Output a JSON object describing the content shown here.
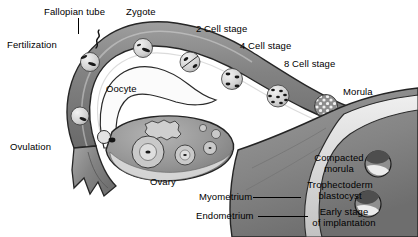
{
  "diagram": {
    "type": "anatomical-illustration",
    "style": "grayscale halftone medical illustration",
    "background_color": "#ffffff",
    "text_color": "#000000"
  },
  "labels": {
    "fallopian_tube": "Fallopian tube",
    "zygote": "Zygote",
    "fertilization": "Fertilization",
    "two_cell": "2 Cell stage",
    "four_cell": "4 Cell stage",
    "eight_cell": "8 Cell stage",
    "oocyte": "Oocyte",
    "morula": "Morula",
    "ovulation": "Ovulation",
    "ovary": "Ovary",
    "myometrium": "Myometrium",
    "endometrium": "Endometrium",
    "compacted_morula_l1": "Compacted",
    "compacted_morula_l2": "morula",
    "trophectoderm_l1": "Trophectoderm",
    "trophectoderm_l2": "blastocyst",
    "early_stage_l1": "Early stage",
    "early_stage_l2": "of implantation"
  },
  "structures": {
    "tube_wall_color": "#8a8a8a",
    "tube_wall_dark": "#6d6d6d",
    "lumen_color": "#d8d8d8",
    "ovary_color": "#9a9a9a",
    "uterus_color": "#8f8f8f",
    "highlight_color": "#e8e8e8",
    "outline_color": "#1a1a1a"
  },
  "stages": [
    {
      "name": "fertilization",
      "cells": 1,
      "note": "oocyte with sperm"
    },
    {
      "name": "zygote",
      "cells": 1
    },
    {
      "name": "2 cell stage",
      "cells": 2
    },
    {
      "name": "4 cell stage",
      "cells": 4
    },
    {
      "name": "8 cell stage",
      "cells": 8
    },
    {
      "name": "morula",
      "cells": 16
    },
    {
      "name": "compacted morula",
      "cells": 32
    },
    {
      "name": "trophectoderm blastocyst",
      "cells": 64
    },
    {
      "name": "early stage of implantation",
      "cells": 100
    }
  ]
}
